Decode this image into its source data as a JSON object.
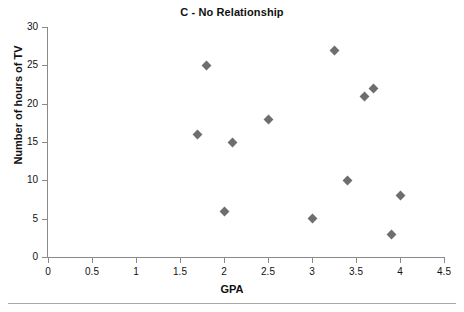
{
  "chart_data": {
    "type": "scatter",
    "title": "C - No Relationship",
    "xlabel": "GPA",
    "ylabel": "Number of hours of TV",
    "xlim": [
      0,
      4.5
    ],
    "ylim": [
      0,
      30
    ],
    "xticks": [
      "0",
      "0.5",
      "1",
      "1.5",
      "2",
      "2.5",
      "3",
      "3.5",
      "4",
      "4.5"
    ],
    "xtick_values": [
      0,
      0.5,
      1,
      1.5,
      2,
      2.5,
      3,
      3.5,
      4,
      4.5
    ],
    "yticks": [
      "0",
      "5",
      "10",
      "15",
      "20",
      "25",
      "30"
    ],
    "ytick_values": [
      0,
      5,
      10,
      15,
      20,
      25,
      30
    ],
    "grid": false,
    "legend": null,
    "marker_shape": "diamond",
    "marker_color": "#6e6e6e",
    "axis_color": "#8a8a8a",
    "points": [
      {
        "x": 1.7,
        "y": 16
      },
      {
        "x": 1.8,
        "y": 25
      },
      {
        "x": 2.0,
        "y": 6
      },
      {
        "x": 2.1,
        "y": 15
      },
      {
        "x": 2.5,
        "y": 18
      },
      {
        "x": 3.0,
        "y": 5
      },
      {
        "x": 3.25,
        "y": 27
      },
      {
        "x": 3.4,
        "y": 10
      },
      {
        "x": 3.6,
        "y": 21
      },
      {
        "x": 3.7,
        "y": 22
      },
      {
        "x": 3.9,
        "y": 3
      },
      {
        "x": 4.0,
        "y": 8
      }
    ]
  }
}
